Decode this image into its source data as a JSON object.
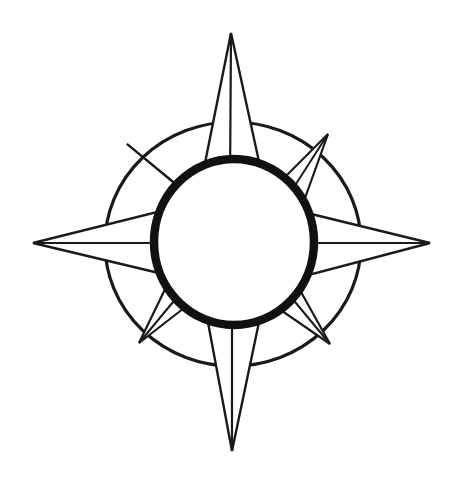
{
  "document": {
    "title": "Compass Rose",
    "kind": "line-art-illustration",
    "background_color": "#ffffff",
    "ink_color": "#1a1a1a",
    "canvas": {
      "width": 461,
      "height": 484
    }
  },
  "figure": {
    "name": "compass-rose",
    "center": {
      "x": 233,
      "y": 243
    },
    "outer_ring": {
      "label": "outer-ring",
      "cx": 233,
      "cy": 244,
      "rx": 128,
      "ry": 122,
      "stroke_width": 3.2,
      "stroke_color": "#1a1a1a",
      "fill": "none"
    },
    "inner_ring": {
      "label": "inner-ring",
      "cx": 234,
      "cy": 242,
      "rx": 80,
      "ry": 83,
      "stroke_width": 8.5,
      "stroke_color": "#111111",
      "fill": "#ffffff"
    },
    "points_count": 8,
    "major_points": [
      {
        "name": "north",
        "tip": {
          "x": 231,
          "y": 33
        },
        "base_left": {
          "x": 201,
          "y": 183
        },
        "base_right": {
          "x": 263,
          "y": 180
        },
        "spine_to": {
          "x": 230,
          "y": 185
        }
      },
      {
        "name": "east",
        "tip": {
          "x": 430,
          "y": 243
        },
        "base_left": {
          "x": 303,
          "y": 212
        },
        "base_right": {
          "x": 305,
          "y": 276
        },
        "spine_to": {
          "x": 300,
          "y": 243
        }
      },
      {
        "name": "south",
        "tip": {
          "x": 232,
          "y": 451
        },
        "base_left": {
          "x": 204,
          "y": 301
        },
        "base_right": {
          "x": 263,
          "y": 303
        },
        "spine_to": {
          "x": 232,
          "y": 300
        }
      },
      {
        "name": "west",
        "tip": {
          "x": 33,
          "y": 243
        },
        "base_left": {
          "x": 163,
          "y": 274
        },
        "base_right": {
          "x": 161,
          "y": 211
        },
        "spine_to": {
          "x": 166,
          "y": 243
        }
      }
    ],
    "minor_points": [
      {
        "name": "northwest",
        "tip": {
          "x": 127,
          "y": 144
        },
        "base_left": {
          "x": 171,
          "y": 180
        },
        "base_right": {
          "x": 203,
          "y": 207
        },
        "spine_to": {
          "x": 183,
          "y": 190
        }
      },
      {
        "name": "northeast",
        "tip": {
          "x": 328,
          "y": 134
        },
        "base_left": {
          "x": 273,
          "y": 189
        },
        "base_right": {
          "x": 300,
          "y": 212
        },
        "spine_to": {
          "x": 287,
          "y": 198
        }
      },
      {
        "name": "southeast",
        "tip": {
          "x": 330,
          "y": 344
        },
        "base_left": {
          "x": 296,
          "y": 283
        },
        "base_right": {
          "x": 269,
          "y": 302
        },
        "spine_to": {
          "x": 286,
          "y": 291
        }
      },
      {
        "name": "southwest",
        "tip": {
          "x": 139,
          "y": 343
        },
        "base_left": {
          "x": 197,
          "y": 298
        },
        "base_right": {
          "x": 170,
          "y": 279
        },
        "spine_to": {
          "x": 183,
          "y": 290
        }
      }
    ]
  }
}
